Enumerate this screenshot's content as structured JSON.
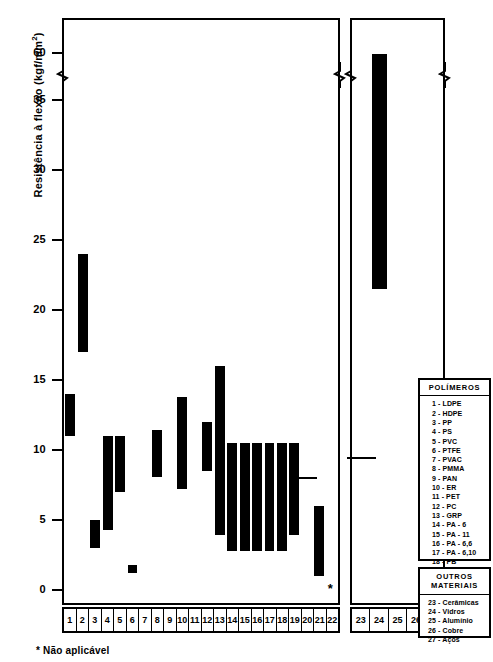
{
  "chart_data": {
    "type": "bar",
    "title": "",
    "ylabel": "Resistência à flexão (kgf/mm²)",
    "xlabel": "",
    "grid": false,
    "axis_break": {
      "after": 35,
      "before": 60
    },
    "ytick_labels": [
      "0",
      "5",
      "10",
      "15",
      "20",
      "25",
      "30",
      "35",
      "60"
    ],
    "ytick_values": [
      0,
      5,
      10,
      15,
      20,
      25,
      30,
      35,
      60
    ],
    "ylim": [
      0,
      62
    ],
    "orientation": "vertical-range-bars",
    "note": "Each bar spans a min-max property range for the material",
    "categories": [
      "1",
      "2",
      "3",
      "4",
      "5",
      "6",
      "7",
      "8",
      "9",
      "10",
      "11",
      "12",
      "13",
      "14",
      "15",
      "16",
      "17",
      "18",
      "19",
      "20",
      "21",
      "22",
      "23",
      "24",
      "25",
      "26",
      "27"
    ],
    "series": [
      {
        "name": "Resistência à flexão",
        "values": [
          {
            "cat": "1",
            "low": 11.0,
            "high": 14.0,
            "kind": "bar"
          },
          {
            "cat": "2",
            "low": 17.0,
            "high": 24.0,
            "kind": "bar"
          },
          {
            "cat": "3",
            "low": 3.0,
            "high": 5.0,
            "kind": "bar"
          },
          {
            "cat": "4",
            "low": 4.3,
            "high": 11.0,
            "kind": "bar"
          },
          {
            "cat": "5",
            "low": 7.0,
            "high": 11.0,
            "kind": "bar"
          },
          {
            "cat": "6",
            "low": 1.2,
            "high": 1.8,
            "kind": "bar"
          },
          {
            "cat": "7",
            "low": 0.0,
            "high": 0.0,
            "kind": "none"
          },
          {
            "cat": "8",
            "low": 8.1,
            "high": 11.4,
            "kind": "bar"
          },
          {
            "cat": "9",
            "low": 0.0,
            "high": 0.0,
            "kind": "none"
          },
          {
            "cat": "10",
            "low": 7.2,
            "high": 13.8,
            "kind": "bar"
          },
          {
            "cat": "11",
            "low": 0.0,
            "high": 0.0,
            "kind": "none"
          },
          {
            "cat": "12",
            "low": 8.5,
            "high": 12.0,
            "kind": "bar"
          },
          {
            "cat": "13",
            "low": 3.9,
            "high": 16.0,
            "kind": "bar"
          },
          {
            "cat": "14",
            "low": 2.8,
            "high": 10.5,
            "kind": "bar"
          },
          {
            "cat": "15",
            "low": 2.8,
            "high": 10.5,
            "kind": "bar"
          },
          {
            "cat": "16",
            "low": 2.8,
            "high": 10.5,
            "kind": "bar"
          },
          {
            "cat": "17",
            "low": 2.8,
            "high": 10.5,
            "kind": "bar"
          },
          {
            "cat": "18",
            "low": 2.8,
            "high": 10.5,
            "kind": "bar"
          },
          {
            "cat": "19",
            "low": 3.9,
            "high": 10.5,
            "kind": "bar"
          },
          {
            "cat": "20",
            "low": 8.1,
            "high": 8.1,
            "kind": "dash"
          },
          {
            "cat": "21",
            "low": 1.0,
            "high": 6.0,
            "kind": "bar"
          },
          {
            "cat": "22",
            "low": null,
            "high": null,
            "kind": "not-applicable"
          },
          {
            "cat": "23",
            "low": 9.5,
            "high": 9.5,
            "kind": "dash"
          },
          {
            "cat": "24",
            "low": 21.5,
            "high": 59.5,
            "kind": "bar"
          },
          {
            "cat": "25",
            "low": 0.0,
            "high": 0.0,
            "kind": "none"
          },
          {
            "cat": "26",
            "low": 0.0,
            "high": 0.0,
            "kind": "none"
          },
          {
            "cat": "27",
            "low": 0.0,
            "high": 0.0,
            "kind": "none"
          }
        ]
      }
    ]
  },
  "axis": {
    "y_title": "Resistência à flexão",
    "y_units_open": "(kgf/mm",
    "y_units_exp": "2",
    "y_units_close": ")",
    "ticks": [
      {
        "label": "60",
        "value": 60
      },
      {
        "label": "35",
        "value": 35
      },
      {
        "label": "30",
        "value": 30
      },
      {
        "label": "25",
        "value": 25
      },
      {
        "label": "20",
        "value": 20
      },
      {
        "label": "15",
        "value": 15
      },
      {
        "label": "10",
        "value": 10
      },
      {
        "label": "5",
        "value": 5
      },
      {
        "label": "0",
        "value": 0
      }
    ]
  },
  "main_panel": {
    "categories": [
      "1",
      "2",
      "3",
      "4",
      "5",
      "6",
      "7",
      "8",
      "9",
      "10",
      "11",
      "12",
      "13",
      "14",
      "15",
      "16",
      "17",
      "18",
      "19",
      "20",
      "21",
      "22"
    ]
  },
  "side_panel": {
    "categories": [
      "23",
      "24",
      "25",
      "26",
      "27"
    ]
  },
  "polymer_legend": {
    "title": "POLÍMEROS",
    "items": [
      "1 - LDPE",
      "2 - HDPE",
      "3 - PP",
      "4 - PS",
      "5 - PVC",
      "6 - PTFE",
      "7 - PVAC",
      "8 - PMMA",
      "9 - PAN",
      "10 - ER",
      "11 - PET",
      "12 - PC",
      "13 - GRP",
      "14 - PA - 6",
      "15 - PA - 11",
      "16 - PA - 6,6",
      "17 - PA - 6,10",
      "18 - PB",
      "19 - UR",
      "20 - MR",
      "21 - PU",
      "22 - NR"
    ]
  },
  "other_legend": {
    "title_line1": "OUTROS",
    "title_line2": "MATERIAIS",
    "items": [
      "23 - Cerâmicas",
      "24 - Vidros",
      "25 - Alumínio",
      "26 - Cobre",
      "27 - Aços"
    ]
  },
  "footnote": {
    "text": "* Não aplicável"
  },
  "colors": {
    "bar": "#000000",
    "axis": "#000000",
    "background": "#ffffff"
  }
}
